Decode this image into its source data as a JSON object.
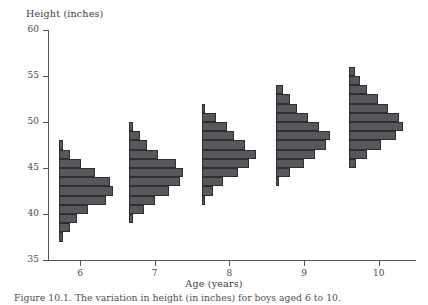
{
  "axes": {
    "ylabel": "Height (inches)",
    "xlabel": "Age (years)",
    "yticks": [
      35,
      40,
      45,
      50,
      55,
      60
    ],
    "ytick_labels": [
      "35",
      "40",
      "45",
      "50",
      "55",
      "60"
    ],
    "xticks": [
      6,
      7,
      8,
      9,
      10
    ],
    "xtick_labels": [
      "6",
      "7",
      "8",
      "9",
      "10"
    ],
    "ylim": [
      35,
      60
    ],
    "xlim": [
      5.57,
      10.5
    ],
    "grid": false
  },
  "caption": {
    "label": "Figure 10.1.",
    "text": "The variation in height (in inches) for boys aged 6 to 10."
  },
  "style": {
    "bar_fill": "#58585c",
    "bar_edge": "#2e2e31",
    "axis_color": "#55555a",
    "background": "#ffffff"
  },
  "chart_data": {
    "type": "bar",
    "orientation": "horizontal-histogram-series",
    "title": "",
    "xlabel": "Age (years)",
    "ylabel": "Height (inches)",
    "ylim": [
      35,
      60
    ],
    "bin_width": 1,
    "series": [
      {
        "name": "6",
        "age": 6,
        "baseline_x": 5.72,
        "bins": [
          {
            "height_low": 37,
            "height_high": 38,
            "count": 0.5
          },
          {
            "height_low": 38,
            "height_high": 39,
            "count": 1.5
          },
          {
            "height_low": 39,
            "height_high": 40,
            "count": 2.5
          },
          {
            "height_low": 40,
            "height_high": 41,
            "count": 4.0
          },
          {
            "height_low": 41,
            "height_high": 42,
            "count": 6.5
          },
          {
            "height_low": 42,
            "height_high": 43,
            "count": 7.5
          },
          {
            "height_low": 43,
            "height_high": 44,
            "count": 7.0
          },
          {
            "height_low": 44,
            "height_high": 45,
            "count": 5.0
          },
          {
            "height_low": 45,
            "height_high": 46,
            "count": 3.0
          },
          {
            "height_low": 46,
            "height_high": 47,
            "count": 1.5
          },
          {
            "height_low": 47,
            "height_high": 48,
            "count": 0.5
          }
        ]
      },
      {
        "name": "7",
        "age": 7,
        "baseline_x": 6.66,
        "bins": [
          {
            "height_low": 39,
            "height_high": 40,
            "count": 0.5
          },
          {
            "height_low": 40,
            "height_high": 41,
            "count": 2.0
          },
          {
            "height_low": 41,
            "height_high": 42,
            "count": 3.5
          },
          {
            "height_low": 42,
            "height_high": 43,
            "count": 5.5
          },
          {
            "height_low": 43,
            "height_high": 44,
            "count": 7.0
          },
          {
            "height_low": 44,
            "height_high": 45,
            "count": 7.5
          },
          {
            "height_low": 45,
            "height_high": 46,
            "count": 6.5
          },
          {
            "height_low": 46,
            "height_high": 47,
            "count": 4.0
          },
          {
            "height_low": 47,
            "height_high": 48,
            "count": 2.5
          },
          {
            "height_low": 48,
            "height_high": 49,
            "count": 1.5
          },
          {
            "height_low": 49,
            "height_high": 50,
            "count": 0.5
          }
        ]
      },
      {
        "name": "8",
        "age": 8,
        "baseline_x": 7.63,
        "bins": [
          {
            "height_low": 41,
            "height_high": 42,
            "count": 0.5
          },
          {
            "height_low": 42,
            "height_high": 43,
            "count": 1.5
          },
          {
            "height_low": 43,
            "height_high": 44,
            "count": 3.0
          },
          {
            "height_low": 44,
            "height_high": 45,
            "count": 5.0
          },
          {
            "height_low": 45,
            "height_high": 46,
            "count": 6.5
          },
          {
            "height_low": 46,
            "height_high": 47,
            "count": 7.5
          },
          {
            "height_low": 47,
            "height_high": 48,
            "count": 6.0
          },
          {
            "height_low": 48,
            "height_high": 49,
            "count": 4.5
          },
          {
            "height_low": 49,
            "height_high": 50,
            "count": 3.5
          },
          {
            "height_low": 50,
            "height_high": 51,
            "count": 2.0
          },
          {
            "height_low": 51,
            "height_high": 52,
            "count": 0.5
          }
        ]
      },
      {
        "name": "9",
        "age": 9,
        "baseline_x": 8.62,
        "bins": [
          {
            "height_low": 43,
            "height_high": 44,
            "count": 0.5
          },
          {
            "height_low": 44,
            "height_high": 45,
            "count": 2.0
          },
          {
            "height_low": 45,
            "height_high": 46,
            "count": 4.0
          },
          {
            "height_low": 46,
            "height_high": 47,
            "count": 5.5
          },
          {
            "height_low": 47,
            "height_high": 48,
            "count": 7.0
          },
          {
            "height_low": 48,
            "height_high": 49,
            "count": 7.5
          },
          {
            "height_low": 49,
            "height_high": 50,
            "count": 6.0
          },
          {
            "height_low": 50,
            "height_high": 51,
            "count": 4.5
          },
          {
            "height_low": 51,
            "height_high": 52,
            "count": 3.0
          },
          {
            "height_low": 52,
            "height_high": 53,
            "count": 2.0
          },
          {
            "height_low": 53,
            "height_high": 54,
            "count": 1.0
          }
        ]
      },
      {
        "name": "10",
        "age": 10,
        "baseline_x": 9.6,
        "bins": [
          {
            "height_low": 45,
            "height_high": 46,
            "count": 1.0
          },
          {
            "height_low": 46,
            "height_high": 47,
            "count": 2.5
          },
          {
            "height_low": 47,
            "height_high": 48,
            "count": 4.5
          },
          {
            "height_low": 48,
            "height_high": 49,
            "count": 6.5
          },
          {
            "height_low": 49,
            "height_high": 50,
            "count": 7.5
          },
          {
            "height_low": 50,
            "height_high": 51,
            "count": 7.0
          },
          {
            "height_low": 51,
            "height_high": 52,
            "count": 5.5
          },
          {
            "height_low": 52,
            "height_high": 53,
            "count": 4.0
          },
          {
            "height_low": 53,
            "height_high": 54,
            "count": 2.5
          },
          {
            "height_low": 54,
            "height_high": 55,
            "count": 1.5
          },
          {
            "height_low": 55,
            "height_high": 56,
            "count": 0.8
          }
        ]
      }
    ]
  }
}
